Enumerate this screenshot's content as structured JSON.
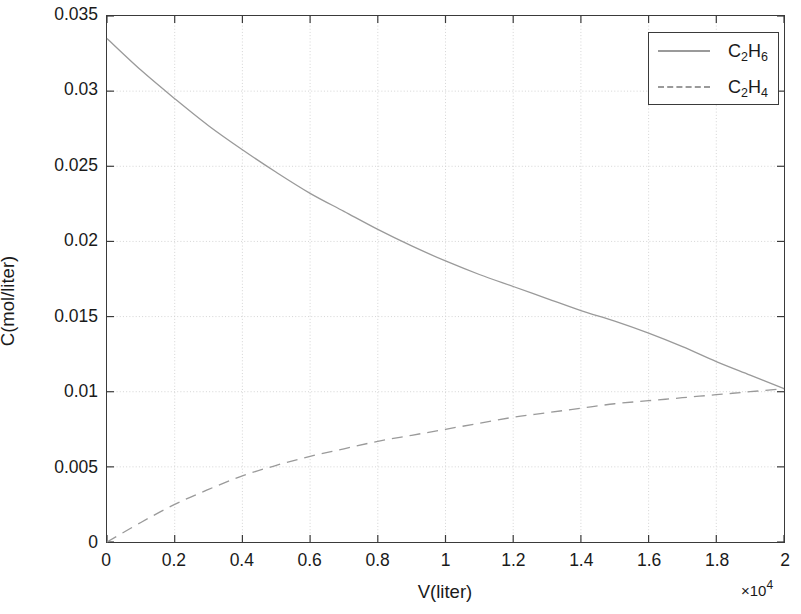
{
  "chart_data": {
    "type": "line",
    "title": "",
    "xlabel": "V(liter)",
    "ylabel": "C(mol/liter)",
    "x_exponent_label": "×10",
    "x_exponent_power": "4",
    "x_exponent_multiplier": 10000,
    "xlim": [
      0,
      2
    ],
    "ylim": [
      0,
      0.035
    ],
    "x_ticks": [
      "0",
      "0.2",
      "0.4",
      "0.6",
      "0.8",
      "1",
      "1.2",
      "1.4",
      "1.6",
      "1.8",
      "2"
    ],
    "x_tick_values": [
      0,
      0.2,
      0.4,
      0.6,
      0.8,
      1,
      1.2,
      1.4,
      1.6,
      1.8,
      2
    ],
    "y_ticks": [
      "0",
      "0.005",
      "0.01",
      "0.015",
      "0.02",
      "0.025",
      "0.03",
      "0.035"
    ],
    "y_tick_values": [
      0,
      0.005,
      0.01,
      0.015,
      0.02,
      0.025,
      0.03,
      0.035
    ],
    "grid": true,
    "grid_style": "dotted",
    "legend_position": "top-right",
    "legend": [
      "C2H6",
      "C2H4"
    ],
    "x": [
      0,
      0.1,
      0.2,
      0.3,
      0.4,
      0.5,
      0.6,
      0.7,
      0.8,
      0.9,
      1.0,
      1.1,
      1.2,
      1.3,
      1.4,
      1.5,
      1.6,
      1.7,
      1.8,
      1.9,
      2.0
    ],
    "series": [
      {
        "name": "C2H6",
        "style": "solid",
        "color": "#9a9a9a",
        "values": [
          0.0335,
          0.0314,
          0.0295,
          0.0277,
          0.0261,
          0.0246,
          0.0232,
          0.022,
          0.0208,
          0.0197,
          0.0187,
          0.0178,
          0.017,
          0.0162,
          0.0154,
          0.0147,
          0.0139,
          0.013,
          0.012,
          0.0111,
          0.0102
        ]
      },
      {
        "name": "C2H4",
        "style": "dashed",
        "color": "#9a9a9a",
        "values": [
          0.0,
          0.0013,
          0.0025,
          0.0035,
          0.0044,
          0.0051,
          0.0057,
          0.0062,
          0.0067,
          0.0071,
          0.0075,
          0.0079,
          0.0083,
          0.0086,
          0.0089,
          0.0092,
          0.0094,
          0.0096,
          0.0098,
          0.01,
          0.0102
        ]
      }
    ]
  },
  "legend_entries": [
    {
      "label_base": "C",
      "sub1": "2",
      "label_mid": "H",
      "sub2": "6",
      "style": "solid"
    },
    {
      "label_base": "C",
      "sub1": "2",
      "label_mid": "H",
      "sub2": "4",
      "style": "dashed"
    }
  ],
  "axes": {
    "x_title": "V(liter)",
    "y_title": "C(mol/liter)",
    "exponent_prefix": "×10",
    "exponent_power": "4"
  },
  "colors": {
    "axis": "#3a3a3a",
    "grid": "#d0d0d0",
    "curve": "#9a9a9a",
    "background": "#ffffff",
    "text": "#1a1a1a"
  }
}
